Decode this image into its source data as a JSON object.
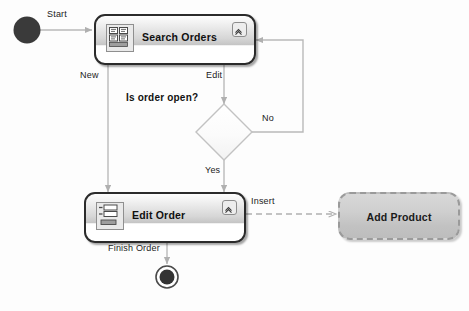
{
  "diagram": {
    "type": "uml-activity-diagram",
    "width": 469,
    "height": 311,
    "background": "#fdfdfd"
  },
  "nodes": {
    "start": {
      "name": "start-node",
      "shape": "filled-circle",
      "color": "#333333"
    },
    "search_orders": {
      "title": "Search Orders",
      "icon": "search-results-grid-icon",
      "badge": "collapse-chevron-icon"
    },
    "decision": {
      "name": "decision-diamond",
      "shape": "diamond"
    },
    "edit_order": {
      "title": "Edit Order",
      "icon": "form-fields-icon",
      "badge": "collapse-chevron-icon"
    },
    "add_product": {
      "title": "Add Product",
      "style": "dashed-ghost"
    },
    "end": {
      "name": "end-node",
      "shape": "bullseye-circle",
      "color": "#333333"
    }
  },
  "edges": [
    {
      "id": "start-to-search",
      "label": "Start",
      "style": "solid"
    },
    {
      "id": "search-to-editorder",
      "label": "New",
      "style": "solid"
    },
    {
      "id": "search-to-decision",
      "label": "Edit",
      "style": "solid"
    },
    {
      "id": "decision-question",
      "label": "Is order open?",
      "style": "annotation",
      "bold": true
    },
    {
      "id": "decision-no-to-search",
      "label": "No",
      "style": "solid"
    },
    {
      "id": "decision-yes-to-edit",
      "label": "Yes",
      "style": "solid"
    },
    {
      "id": "editorder-to-end",
      "label": "Finish Order",
      "style": "solid"
    },
    {
      "id": "editorder-to-addproduct",
      "label": "Insert",
      "style": "dashed"
    }
  ],
  "colors": {
    "line": "#b9b9b9",
    "node_border": "#2b2b2b",
    "ghost_border": "#9a9a9a",
    "text": "#111111"
  }
}
